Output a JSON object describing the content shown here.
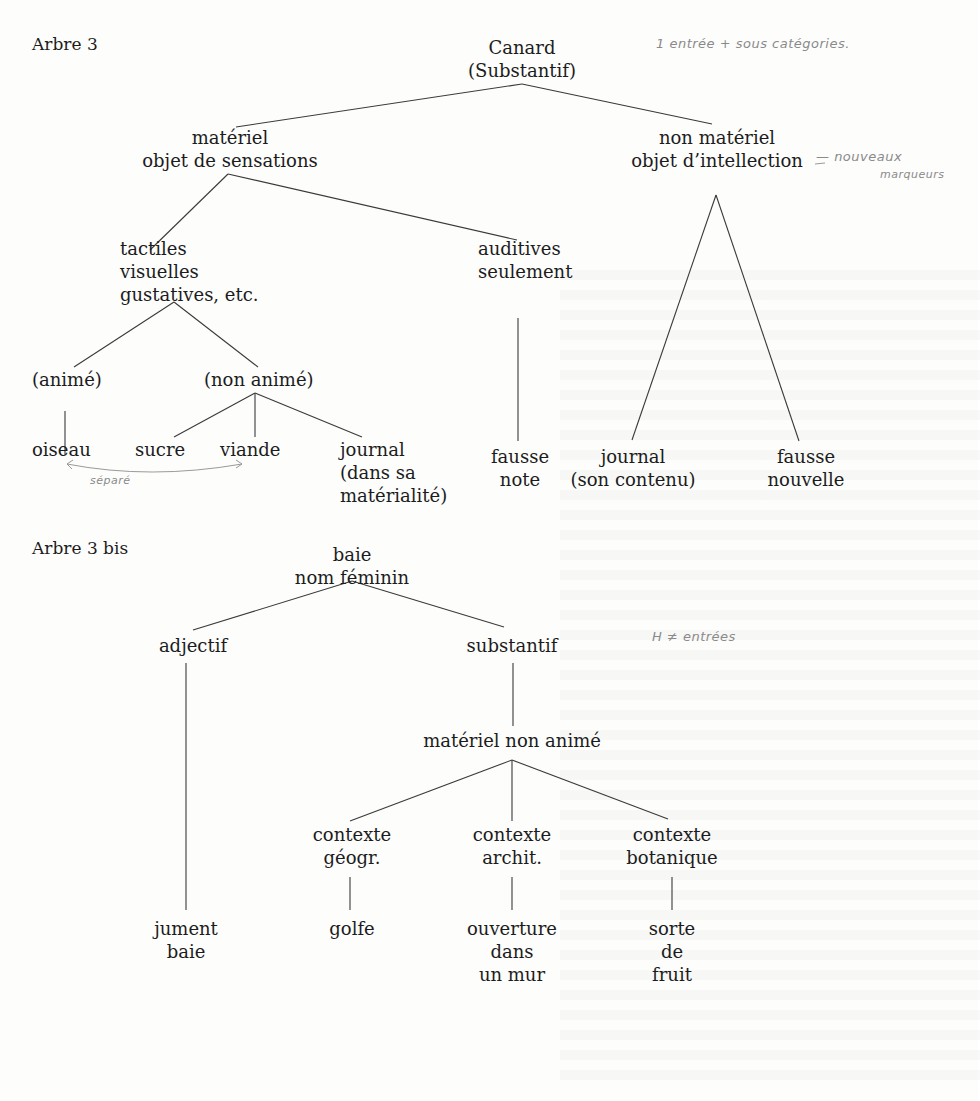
{
  "tree1": {
    "title": "Arbre 3",
    "root": [
      "Canard",
      "(Substantif)"
    ],
    "materiel": [
      "matériel",
      "objet de sensations"
    ],
    "non_materiel": [
      "non matériel",
      "objet d’intellection"
    ],
    "tactiles": [
      "tactiles",
      "visuelles",
      "gustatives, etc."
    ],
    "auditives": [
      "auditives",
      "seulement"
    ],
    "anime": "(animé)",
    "non_anime": "(non animé)",
    "leaves": {
      "oiseau": "oiseau",
      "sucre": "sucre",
      "viande": "viande",
      "journal_materiel": [
        "journal",
        "(dans sa",
        "matérialité)"
      ],
      "fausse_note": [
        "fausse",
        "note"
      ],
      "journal_contenu": [
        "journal",
        "(son contenu)"
      ],
      "fausse_nouvelle": [
        "fausse",
        "nouvelle"
      ]
    },
    "annotations": {
      "top": "1 entrée + sous catégories.",
      "nouveaux": "— nouveaux",
      "marqueurs": "marqueurs",
      "separe": "séparé"
    }
  },
  "tree2": {
    "title": "Arbre 3 bis",
    "root": [
      "baie",
      "nom féminin"
    ],
    "adjectif": "adjectif",
    "substantif": "substantif",
    "materiel_non_anime": "matériel non animé",
    "contexte_geogr": [
      "contexte",
      "géogr."
    ],
    "contexte_archit": [
      "contexte",
      "archit."
    ],
    "contexte_botanique": [
      "contexte",
      "botanique"
    ],
    "leaves": {
      "jument": [
        "jument",
        "baie"
      ],
      "golfe": "golfe",
      "ouverture": [
        "ouverture",
        "dans",
        "un mur"
      ],
      "fruit": [
        "sorte",
        "de",
        "fruit"
      ]
    },
    "annotations": {
      "entrees": "H ≠ entrées"
    }
  }
}
